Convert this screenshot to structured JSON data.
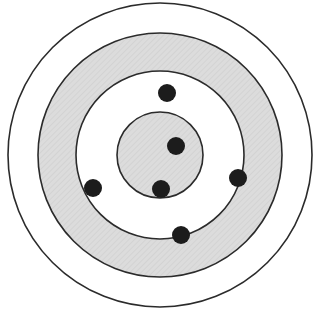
{
  "figure": {
    "name": "concentric-target-diagram",
    "title": "",
    "canvas": {
      "width": 323,
      "height": 321,
      "background": "#ffffff"
    },
    "center": {
      "x": 160,
      "y": 155
    }
  },
  "chart_data": {
    "type": "scatter",
    "title": "",
    "subtitle": "",
    "xlabel": "",
    "ylabel": "",
    "xlim": [
      0,
      323
    ],
    "ylim": [
      0,
      321
    ],
    "grid": false,
    "legend": null,
    "annotations": [],
    "tick_labels": {
      "x": [],
      "y": []
    },
    "center": {
      "x": 160,
      "y": 155
    },
    "rings": [
      {
        "name": "outer-ring",
        "index": 1,
        "radius": 152,
        "fill": "#ffffff",
        "fill_label": "white",
        "stroke": "#2b2b2b",
        "stroke_width": 1.6,
        "hatched": false
      },
      {
        "name": "middle-ring-shaded",
        "index": 2,
        "radius": 122,
        "fill": "#d9d9d9",
        "fill_label": "light-gray-hatched",
        "stroke": "#2b2b2b",
        "stroke_width": 1.6,
        "hatched": true
      },
      {
        "name": "inner-ring-white",
        "index": 3,
        "radius": 84,
        "fill": "#ffffff",
        "fill_label": "white",
        "stroke": "#2b2b2b",
        "stroke_width": 1.6,
        "hatched": false
      },
      {
        "name": "core-ring-shaded",
        "index": 4,
        "radius": 43,
        "fill": "#d9d9d9",
        "fill_label": "light-gray-hatched",
        "stroke": "#2b2b2b",
        "stroke_width": 1.6,
        "hatched": true
      }
    ],
    "points": [
      {
        "name": "center-point",
        "x": 176,
        "y": 146,
        "r": 9,
        "color": "#1c1c1c",
        "ring": "core-ring-shaded",
        "position": "interior"
      },
      {
        "name": "core-boundary-point",
        "x": 161,
        "y": 189,
        "r": 9,
        "color": "#1c1c1c",
        "ring": "core-ring-shaded",
        "position": "boundary"
      },
      {
        "name": "inner-boundary-top-point",
        "x": 167,
        "y": 93,
        "r": 9,
        "color": "#1c1c1c",
        "ring": "inner-ring-white",
        "position": "boundary"
      },
      {
        "name": "inner-boundary-right-point",
        "x": 238,
        "y": 178,
        "r": 9,
        "color": "#1c1c1c",
        "ring": "inner-ring-white",
        "position": "boundary"
      },
      {
        "name": "inner-boundary-left-point",
        "x": 93,
        "y": 188,
        "r": 9,
        "color": "#1c1c1c",
        "ring": "inner-ring-white",
        "position": "boundary"
      },
      {
        "name": "inner-boundary-bottom-point",
        "x": 181,
        "y": 235,
        "r": 9,
        "color": "#1c1c1c",
        "ring": "inner-ring-white",
        "position": "boundary"
      }
    ],
    "counts": {
      "rings": 4,
      "points": 6
    },
    "colors": {
      "stroke": "#2b2b2b",
      "shaded_fill": "#d9d9d9",
      "white_fill": "#ffffff",
      "point_fill": "#1c1c1c"
    }
  }
}
